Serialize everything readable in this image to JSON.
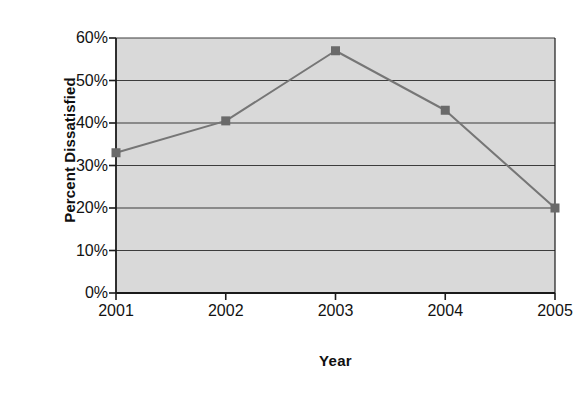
{
  "chart_data": {
    "type": "line",
    "title": "",
    "xlabel": "Year",
    "ylabel": "Percent Dissatisfied",
    "categories": [
      "2001",
      "2002",
      "2003",
      "2004",
      "2005"
    ],
    "values": [
      33,
      40.5,
      57,
      43,
      20
    ],
    "series": [
      {
        "name": "Percent Dissatisfied",
        "values": [
          33,
          40.5,
          57,
          43,
          20
        ]
      }
    ],
    "ylim": [
      0,
      60
    ],
    "ytick_labels": [
      "0%",
      "10%",
      "20%",
      "30%",
      "40%",
      "50%",
      "60%"
    ],
    "ytick_values": [
      0,
      10,
      20,
      30,
      40,
      50,
      60
    ],
    "xtick_labels": [
      "2001",
      "2002",
      "2003",
      "2004",
      "2005"
    ],
    "grid": "horizontal",
    "legend": "none",
    "marker": "square",
    "colors": {
      "plot_background": "#d9d9d9",
      "line": "#767676",
      "marker": "#6a6a6a",
      "gridline": "#3d3d3d",
      "axis": "#1a1a1a",
      "text": "#121212",
      "page_background": "#ffffff"
    }
  }
}
